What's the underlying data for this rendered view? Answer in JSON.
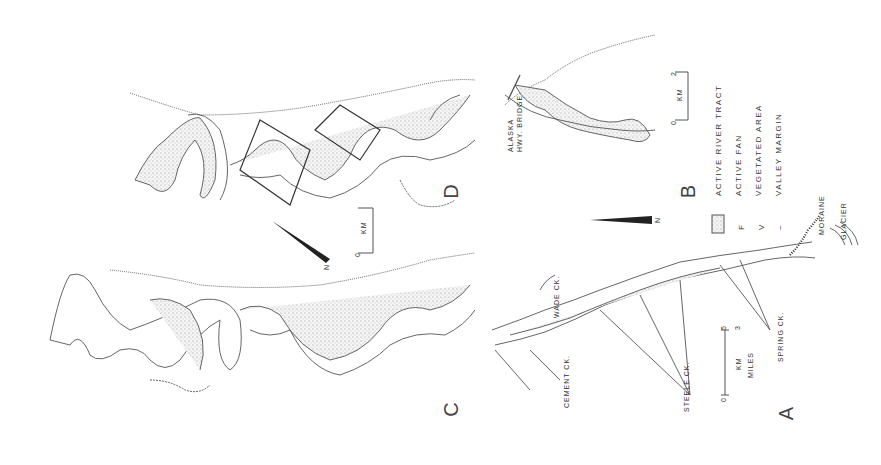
{
  "figure": {
    "panels": [
      {
        "id": "A",
        "label": "A"
      },
      {
        "id": "B",
        "label": "B"
      },
      {
        "id": "C",
        "label": "C"
      },
      {
        "id": "D",
        "label": "D"
      }
    ],
    "legend": {
      "items": [
        {
          "symbol": "stippled-box",
          "label": "ACTIVE RIVER TRACT"
        },
        {
          "symbol": "F",
          "label": "ACTIVE FAN"
        },
        {
          "symbol": "V",
          "label": "VEGETATED AREA"
        },
        {
          "symbol": "~",
          "label": "VALLEY MARGIN"
        }
      ]
    },
    "panel_a": {
      "creeks": [
        "CEMENT CK.",
        "STEELE CK.",
        "WADE CK.",
        "SPRING CK."
      ],
      "features": [
        "MORAINE",
        "GLACIER"
      ],
      "scale": {
        "km_label": "KM",
        "miles_label": "MILES",
        "zero": "0",
        "max_km": "5",
        "max_miles": "3"
      },
      "north": "N",
      "fan_symbol": "F",
      "veg_symbol": "V"
    },
    "panel_b": {
      "bridge_label_1": "ALASKA",
      "bridge_label_2": "HWY. BRIDGE",
      "scale": {
        "label": "KM",
        "zero": "0",
        "max": "2"
      }
    },
    "panel_d": {
      "scale": {
        "label": "KM",
        "zero": "0",
        "max": "1"
      },
      "north": "N"
    }
  }
}
